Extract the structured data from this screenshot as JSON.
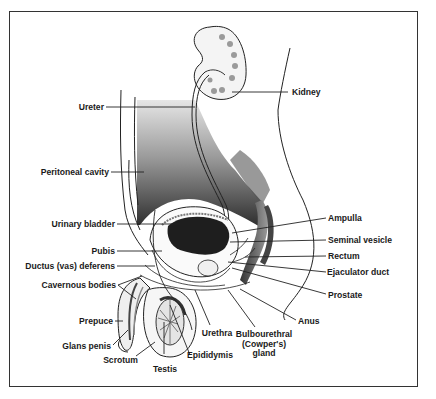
{
  "diagram": {
    "labels_left": [
      {
        "id": "ureter",
        "text": "Ureter"
      },
      {
        "id": "peritoneal-cavity",
        "text": "Peritoneal cavity"
      },
      {
        "id": "urinary-bladder",
        "text": "Urinary bladder"
      },
      {
        "id": "pubis",
        "text": "Pubis"
      },
      {
        "id": "ductus-deferens",
        "text": "Ductus (vas) deferens"
      },
      {
        "id": "cavernous-bodies",
        "text": "Cavernous bodies"
      },
      {
        "id": "prepuce",
        "text": "Prepuce"
      },
      {
        "id": "glans-penis",
        "text": "Glans penis"
      },
      {
        "id": "scrotum",
        "text": "Scrotum"
      }
    ],
    "labels_bottom": [
      {
        "id": "testis",
        "text": "Testis"
      },
      {
        "id": "epididymis",
        "text": "Epididymis"
      },
      {
        "id": "urethra",
        "text": "Urethra"
      },
      {
        "id": "bulbourethral-gland",
        "text": "Bulbourethral (Cowper's) gland",
        "lines": [
          "Bulbourethral",
          "(Cowper's)",
          "gland"
        ]
      }
    ],
    "labels_right": [
      {
        "id": "kidney",
        "text": "Kidney"
      },
      {
        "id": "ampulla",
        "text": "Ampulla"
      },
      {
        "id": "seminal-vesicle",
        "text": "Seminal vesicle"
      },
      {
        "id": "rectum",
        "text": "Rectum"
      },
      {
        "id": "ejaculator-duct",
        "text": "Ejaculator duct"
      },
      {
        "id": "prostate",
        "text": "Prostate"
      },
      {
        "id": "anus",
        "text": "Anus"
      }
    ],
    "colors": {
      "line": "#222222",
      "shade_dark": "#2a2a2a",
      "shade_mid": "#7a7a7a",
      "shade_light": "#cfcfcf",
      "background": "#ffffff"
    }
  }
}
